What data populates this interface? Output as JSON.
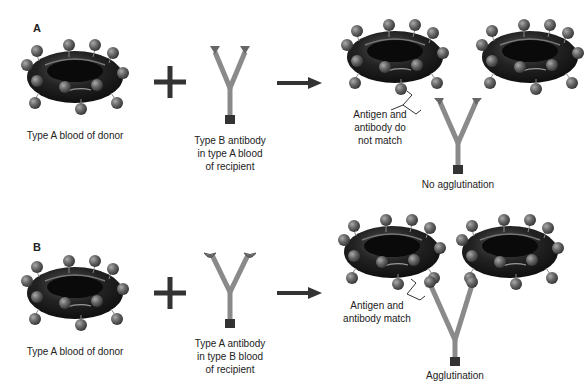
{
  "panels": [
    {
      "letter": "A",
      "donor_caption": "Type A blood of donor",
      "antibody_caption_lines": [
        "Type B antibody",
        "in type A blood",
        "of recipient"
      ],
      "match_label_lines": [
        "Antigen and",
        "antibody do",
        "not match"
      ],
      "result_caption": "No agglutination",
      "antibody_tip_shape": "triangle"
    },
    {
      "letter": "B",
      "donor_caption": "Type A blood of donor",
      "antibody_caption_lines": [
        "Type A antibody",
        "in type B blood",
        "of recipient"
      ],
      "match_label_lines": [
        "Antigen and",
        "antibody match"
      ],
      "result_caption": "Agglutination",
      "antibody_tip_shape": "cup"
    }
  ],
  "symbols": {
    "plus": "plus-sign",
    "arrow": "right-arrow"
  },
  "colors": {
    "cell": "#1a1a1a",
    "antigen": "#5a5a5a",
    "antibody": "#8a8a8a",
    "antibody_base": "#333333",
    "ink": "#222222"
  }
}
